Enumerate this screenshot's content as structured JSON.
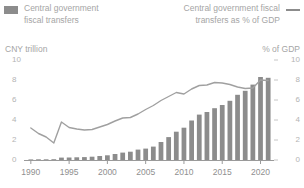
{
  "legend": {
    "bar_label_line1": "Central government",
    "bar_label_line2": "fiscal transfers",
    "line_label_line1": "Central government fiscal",
    "line_label_line2": "transfers as % of GDP",
    "bar_swatch_icon": "filled-rect-swatch",
    "line_swatch_icon": "line-swatch"
  },
  "axes": {
    "left_title": "CNY trillion",
    "right_title": "% of GDP",
    "left_ticks": [
      "10",
      "8",
      "6",
      "4",
      "2",
      "0"
    ],
    "right_ticks": [
      "10",
      "8",
      "6",
      "4",
      "2",
      "0"
    ],
    "x_ticks": [
      "1990",
      "1995",
      "2000",
      "2005",
      "2010",
      "2015",
      "2020"
    ]
  },
  "colors": {
    "bar": "#8c8c8c",
    "line": "#a0a0a0",
    "axis": "#9a9a9a",
    "text": "#a5a5a5",
    "tick_text": "#b4b4b4",
    "background": "#ffffff"
  },
  "chart_data": {
    "type": "bar",
    "title": "",
    "subtitle": "",
    "xlabel": "",
    "ylabel": "CNY trillion",
    "y2label": "% of GDP",
    "ylim": [
      0,
      10
    ],
    "y2lim": [
      0,
      10
    ],
    "grid": false,
    "legend_position": "top",
    "categories": [
      "1990",
      "1991",
      "1992",
      "1993",
      "1994",
      "1995",
      "1996",
      "1997",
      "1998",
      "1999",
      "2000",
      "2001",
      "2002",
      "2003",
      "2004",
      "2005",
      "2006",
      "2007",
      "2008",
      "2009",
      "2010",
      "2011",
      "2012",
      "2013",
      "2014",
      "2015",
      "2016",
      "2017",
      "2018",
      "2019",
      "2020",
      "2021"
    ],
    "series": [
      {
        "name": "Central government fiscal transfers",
        "type": "bar",
        "axis": "left",
        "unit": "CNY trillion",
        "values": [
          0.06,
          0.07,
          0.07,
          0.08,
          0.24,
          0.25,
          0.27,
          0.29,
          0.33,
          0.4,
          0.47,
          0.6,
          0.74,
          0.83,
          1.04,
          1.14,
          1.34,
          1.8,
          2.29,
          2.83,
          3.23,
          3.95,
          4.54,
          4.8,
          5.18,
          5.5,
          5.92,
          6.52,
          6.92,
          7.54,
          8.3,
          8.22
        ]
      },
      {
        "name": "Central government fiscal transfers as % of GDP",
        "type": "line",
        "axis": "right",
        "unit": "% of GDP",
        "values": [
          3.2,
          2.65,
          2.3,
          1.7,
          3.8,
          3.25,
          3.1,
          3.0,
          3.05,
          3.3,
          3.55,
          3.9,
          4.2,
          4.25,
          4.6,
          5.05,
          5.45,
          5.95,
          6.35,
          6.75,
          6.6,
          7.1,
          7.45,
          7.5,
          7.75,
          7.7,
          7.55,
          7.3,
          7.15,
          7.2,
          8.0,
          7.95
        ]
      }
    ]
  }
}
